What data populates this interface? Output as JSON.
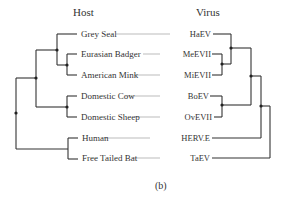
{
  "headers": {
    "host": "Host",
    "virus": "Virus"
  },
  "caption": "(b)",
  "colors": {
    "line": "#333333",
    "connector": "#aaaaaa",
    "text": "#333333",
    "background": "#ffffff"
  },
  "pairs": [
    {
      "host": "Grey Seal",
      "virus": "HaEV",
      "y": 34
    },
    {
      "host": "Eurasian Badger",
      "virus": "MeEVII",
      "y": 54
    },
    {
      "host": "American Mink",
      "virus": "MiEVII",
      "y": 75
    },
    {
      "host": "Domestic Cow",
      "virus": "BoEV",
      "y": 96
    },
    {
      "host": "Domestic Sheep",
      "virus": "OvEVII",
      "y": 117
    },
    {
      "host": "Human",
      "virus": "HERV.E",
      "y": 138
    },
    {
      "host": "Free Tailed Bat",
      "virus": "TaEV",
      "y": 158
    }
  ],
  "host_tree": {
    "segments": [
      [
        57,
        34,
        77,
        34
      ],
      [
        57,
        34,
        57,
        65
      ],
      [
        67,
        54,
        77,
        54
      ],
      [
        67,
        54,
        67,
        75
      ],
      [
        67,
        75,
        77,
        75
      ],
      [
        57,
        65,
        67,
        65
      ],
      [
        36,
        50,
        57,
        50
      ],
      [
        36,
        50,
        36,
        107
      ],
      [
        67,
        96,
        77,
        96
      ],
      [
        67,
        96,
        67,
        117
      ],
      [
        67,
        117,
        77,
        117
      ],
      [
        36,
        107,
        67,
        107
      ],
      [
        16,
        78,
        36,
        78
      ],
      [
        16,
        78,
        16,
        149
      ],
      [
        68,
        138,
        78,
        138
      ],
      [
        68,
        138,
        68,
        159
      ],
      [
        68,
        159,
        78,
        159
      ],
      [
        16,
        149,
        68,
        149
      ]
    ],
    "nodes": [
      [
        57,
        50
      ],
      [
        67,
        65
      ],
      [
        36,
        78
      ],
      [
        67,
        107
      ],
      [
        16,
        113
      ]
    ]
  },
  "virus_tree": {
    "segments": [
      [
        213,
        34,
        231,
        34
      ],
      [
        231,
        34,
        231,
        64
      ],
      [
        212,
        54,
        222,
        54
      ],
      [
        222,
        54,
        222,
        75
      ],
      [
        212,
        75,
        222,
        75
      ],
      [
        222,
        64,
        231,
        64
      ],
      [
        231,
        48,
        251,
        48
      ],
      [
        251,
        48,
        251,
        105
      ],
      [
        210,
        96,
        222,
        96
      ],
      [
        222,
        96,
        222,
        117
      ],
      [
        214,
        117,
        222,
        117
      ],
      [
        222,
        105,
        251,
        105
      ],
      [
        251,
        76,
        261,
        76
      ],
      [
        261,
        76,
        261,
        138
      ],
      [
        212,
        138,
        261,
        138
      ],
      [
        261,
        106,
        270,
        106
      ],
      [
        270,
        106,
        270,
        158
      ],
      [
        212,
        158,
        270,
        158
      ]
    ],
    "nodes": [
      [
        231,
        48
      ],
      [
        222,
        64
      ],
      [
        251,
        76
      ],
      [
        222,
        105
      ],
      [
        261,
        106
      ]
    ]
  },
  "connectors": [
    [
      116,
      34,
      170,
      34
    ],
    [
      143,
      54,
      160,
      54
    ],
    [
      134,
      75,
      160,
      75
    ],
    [
      125,
      96,
      160,
      96
    ],
    [
      135,
      117,
      160,
      117
    ],
    [
      104,
      138,
      150,
      138
    ],
    [
      134,
      158,
      160,
      158
    ]
  ]
}
